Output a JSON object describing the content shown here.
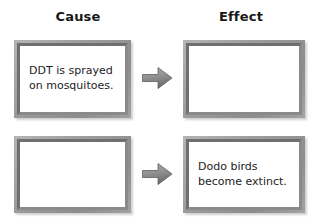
{
  "page": {
    "background_color": "#ffffff"
  },
  "headings": {
    "cause": "Cause",
    "effect": "Effect"
  },
  "colors": {
    "frame": "#9a9a9a",
    "frame_border": "#787878",
    "arrow": "#8c8c8c",
    "text": "#1c1c1c"
  },
  "rows": [
    {
      "cause": {
        "text": "DDT is sprayed\non mosquitoes.",
        "filled": true
      },
      "arrow": {
        "icon": "right-arrow-icon"
      },
      "effect": {
        "text": "",
        "filled": false
      }
    },
    {
      "cause": {
        "text": "",
        "filled": false
      },
      "arrow": {
        "icon": "right-arrow-icon"
      },
      "effect": {
        "text": "Dodo birds\nbecome extinct.",
        "filled": true
      }
    }
  ]
}
